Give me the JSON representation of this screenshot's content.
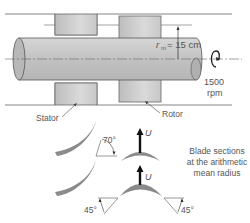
{
  "diagram": {
    "labels": {
      "radius": "= 15 cm",
      "radius_symbol": "r",
      "radius_subscript": "m",
      "speed_value": "1500",
      "speed_unit": "rpm",
      "stator": "Stator",
      "rotor": "Rotor",
      "blade_caption_line1": "Blade sections",
      "blade_caption_line2": "at the arithmetic",
      "blade_caption_line3": "mean radius",
      "velocity_symbol": "U",
      "stator_angle": "70°",
      "rotor_angle_left": "45°",
      "rotor_angle_right": "45°"
    },
    "colors": {
      "shaft_fill": "#c8c8c8",
      "blade_fill": "#8a8a8a",
      "block_fill": "#cfcfcf",
      "line": "#555555",
      "arrow": "#111111"
    }
  }
}
